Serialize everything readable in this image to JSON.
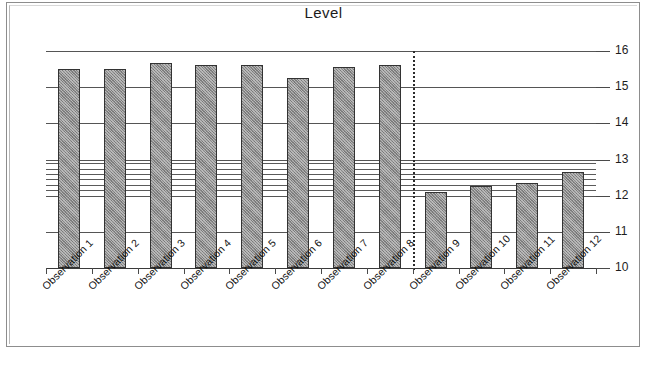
{
  "chart_data": {
    "type": "bar",
    "title": "Level",
    "xlabel": "",
    "ylabel": "",
    "ylim": [
      10,
      16
    ],
    "ytick_values": [
      16,
      15,
      14,
      13,
      12,
      11,
      10
    ],
    "ytick_labels": [
      "16",
      "15",
      "14",
      "13",
      "12",
      "11",
      "10"
    ],
    "grid": true,
    "legend": null,
    "categories": [
      "Observation 1",
      "Observation 2",
      "Observation 3",
      "Observation 4",
      "Observation 5",
      "Observation 6",
      "Observation 7",
      "Observation 8",
      "Observation 9",
      "Observation 10",
      "Observation 11",
      "Observation 12"
    ],
    "values": [
      15.5,
      15.5,
      15.68,
      15.6,
      15.6,
      15.25,
      15.55,
      15.6,
      12.1,
      12.28,
      12.35,
      12.65
    ],
    "annotations": {
      "group_separator": {
        "after_category": "Observation 8",
        "style": "dotted-vertical-line"
      },
      "reference_lines": [
        12.15,
        12.3,
        12.45,
        12.6,
        12.75,
        12.9
      ]
    },
    "colors": {
      "bar_fill": "#8a8a8a",
      "bar_border": "#333333",
      "gridline": "#555555",
      "axis": "#3a3a3a",
      "text": "#101010",
      "background": "#ffffff"
    }
  }
}
